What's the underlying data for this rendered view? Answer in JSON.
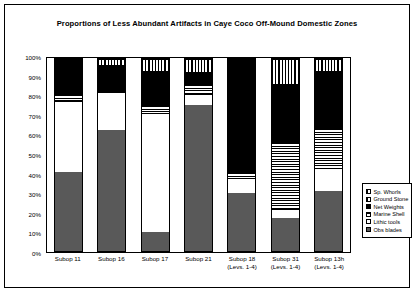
{
  "chart_data": {
    "type": "bar",
    "subtype": "stacked-percentage",
    "title": "Proportions of Less Abundant Artifacts in Caye Coco Off-Mound Domestic Zones",
    "xlabel": "",
    "ylabel": "",
    "ylim": [
      0,
      100
    ],
    "ytick_labels": [
      "0%",
      "10%",
      "20%",
      "30%",
      "40%",
      "50%",
      "60%",
      "70%",
      "80%",
      "90%",
      "100%"
    ],
    "ytick_values": [
      0,
      10,
      20,
      30,
      40,
      50,
      60,
      70,
      80,
      90,
      100
    ],
    "grid": false,
    "legend_position": "right",
    "categories": [
      "Subop 11",
      "Subop 16",
      "Subop 17",
      "Subop 21",
      "Subop 18",
      "Subop 31",
      "Subop 13h"
    ],
    "category_sublabels": [
      "",
      "",
      "",
      "",
      "(Levs. 1-4)",
      "(Levs. 1-4)",
      "(Levs. 1-4)"
    ],
    "series": [
      {
        "name": "Obs blades",
        "fill": "solid-gray",
        "values": [
          41,
          63,
          10,
          76,
          30,
          17,
          31
        ]
      },
      {
        "name": "Lithic tools",
        "fill": "solid-white",
        "values": [
          37,
          20,
          62,
          6,
          8,
          5,
          12
        ]
      },
      {
        "name": "Marine Shell",
        "fill": "horizontal-lines",
        "values": [
          4,
          0,
          4,
          5,
          3,
          35,
          21
        ]
      },
      {
        "name": "Net Weights",
        "fill": "solid-black",
        "values": [
          18,
          14,
          18,
          6,
          59,
          30,
          30
        ]
      },
      {
        "name": "Ground Stone",
        "fill": "vertical-lines",
        "values": [
          0,
          3,
          6,
          7,
          0,
          13,
          6
        ]
      },
      {
        "name": "Sp. Whorls",
        "fill": "vertical-lines",
        "values": [
          0,
          0,
          0,
          0,
          0,
          0,
          0
        ]
      }
    ]
  },
  "legend": {
    "items": [
      {
        "label": "Sp. Whorls",
        "swatch": "vertical-lines"
      },
      {
        "label": "Ground Stone",
        "swatch": "vertical-lines"
      },
      {
        "label": "Net Weights",
        "swatch": "solid-black"
      },
      {
        "label": "Marine Shell",
        "swatch": "horizontal-lines"
      },
      {
        "label": "Lithic tools",
        "swatch": "solid-white"
      },
      {
        "label": "Obs blades",
        "swatch": "solid-gray"
      }
    ]
  },
  "colors": {
    "obs_blades": "#595959",
    "lithic_tools": "#ffffff",
    "net_weights": "#000000",
    "frame": "#000000",
    "background": "#ffffff"
  }
}
